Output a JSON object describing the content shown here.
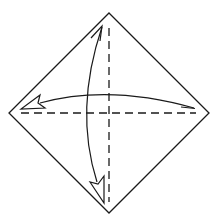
{
  "diagram": {
    "type": "origami-fold-diagram",
    "description": "Square paper rotated as a diamond with two valley-fold crease lines (dashed) and fold-and-unfold arrows",
    "colors": {
      "background": "#ffffff",
      "stroke": "#1a1a1a"
    },
    "paper": {
      "shape": "diamond",
      "points": [
        [
          109,
          13
        ],
        [
          209,
          113
        ],
        [
          109,
          213
        ],
        [
          9,
          113
        ]
      ]
    },
    "creases": [
      {
        "name": "horizontal-valley-fold",
        "style": "dashed",
        "from": [
          20,
          113
        ],
        "to": [
          196,
          113
        ]
      },
      {
        "name": "vertical-valley-fold",
        "style": "dashed",
        "from": [
          109,
          27
        ],
        "to": [
          109,
          202
        ]
      }
    ],
    "arrows": [
      {
        "name": "horizontal-fold-unfold-arrow",
        "direction": "left-right",
        "hollow_head": "left",
        "barb_head": "right"
      },
      {
        "name": "vertical-fold-unfold-arrow",
        "direction": "top-bottom",
        "hollow_head": "bottom",
        "barb_head": "top"
      }
    ]
  }
}
